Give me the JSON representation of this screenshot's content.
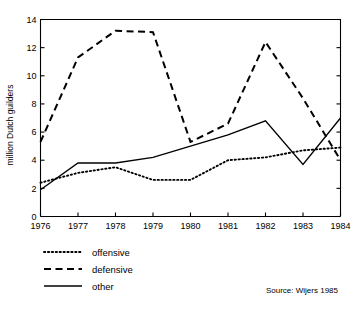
{
  "chart_data": {
    "type": "line",
    "title": "",
    "xlabel": "",
    "ylabel": "million Dutch guilders",
    "categories": [
      "1976",
      "1977",
      "1978",
      "1979",
      "1980",
      "1981",
      "1982",
      "1983",
      "1984"
    ],
    "x": [
      1976,
      1977,
      1978,
      1979,
      1980,
      1981,
      1982,
      1983,
      1984
    ],
    "xlim": [
      1976,
      1984
    ],
    "ylim": [
      0,
      14
    ],
    "yticks": [
      0,
      2,
      4,
      6,
      8,
      10,
      12,
      14
    ],
    "ytick_labels": [
      "0",
      "2",
      "4",
      "6",
      "8",
      "10",
      "12",
      "14"
    ],
    "xticks": [
      1976,
      1977,
      1978,
      1979,
      1980,
      1981,
      1982,
      1983,
      1984
    ],
    "xtick_labels": [
      "1976",
      "1977",
      "1978",
      "1979",
      "1980",
      "1981",
      "1982",
      "1983",
      "1984"
    ],
    "grid": false,
    "legend_position": "below-left",
    "series": [
      {
        "name": "offensive",
        "style": "dotted",
        "color": "#000000",
        "values": [
          2.4,
          3.1,
          3.5,
          2.6,
          2.6,
          4.0,
          4.2,
          4.7,
          4.9
        ]
      },
      {
        "name": "defensive",
        "style": "dashed",
        "color": "#000000",
        "values": [
          5.3,
          11.3,
          13.2,
          13.1,
          5.3,
          6.6,
          12.4,
          8.4,
          4.0
        ]
      },
      {
        "name": "other",
        "style": "solid",
        "color": "#000000",
        "values": [
          1.9,
          3.8,
          3.8,
          4.2,
          5.0,
          5.8,
          6.8,
          3.7,
          7.0
        ]
      }
    ],
    "annotations": [
      {
        "name": "source",
        "text": "Source: Wijers 1985"
      }
    ]
  },
  "legend": {
    "items": [
      {
        "label": "offensive",
        "style": "dotted"
      },
      {
        "label": "defensive",
        "style": "dashed"
      },
      {
        "label": "other",
        "style": "solid"
      }
    ]
  },
  "source": {
    "text": "Source: Wijers 1985"
  }
}
